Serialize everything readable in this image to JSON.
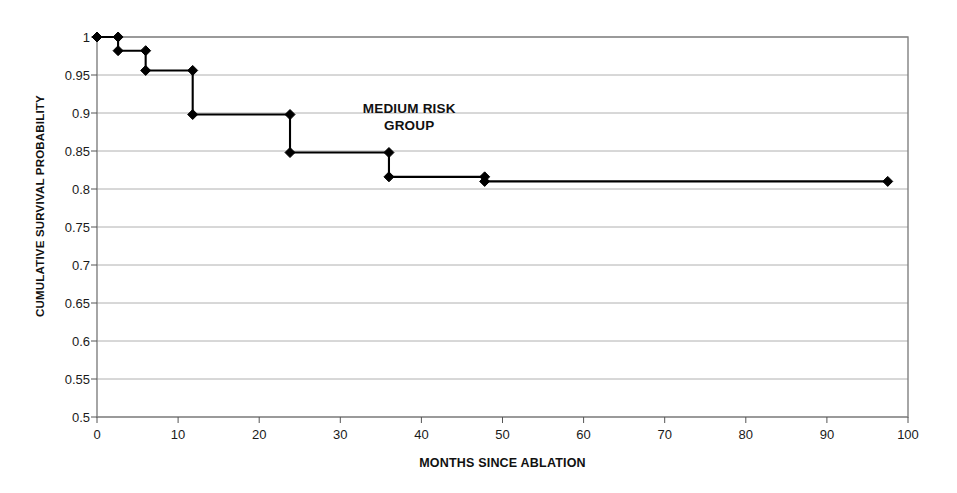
{
  "figure": {
    "background_color": "#ffffff",
    "plot_border_color": "#808080",
    "gridline_color": "#b0b0b0",
    "series_color": "#000000"
  },
  "chart_data": {
    "type": "line",
    "subtype": "kaplan-meier-step",
    "title": "",
    "xlabel": "MONTHS SINCE ABLATION",
    "ylabel": "CUMULATIVE SURVIVAL PROBABILITY",
    "xlim": [
      0,
      100
    ],
    "ylim": [
      0.5,
      1
    ],
    "xticks": [
      0,
      10,
      20,
      30,
      40,
      50,
      60,
      70,
      80,
      90,
      100
    ],
    "xtick_labels": [
      "0",
      "10",
      "20",
      "30",
      "40",
      "50",
      "60",
      "70",
      "80",
      "90",
      "100"
    ],
    "yticks": [
      0.5,
      0.55,
      0.6,
      0.65,
      0.7,
      0.75,
      0.8,
      0.85,
      0.9,
      0.95,
      1
    ],
    "ytick_labels": [
      "0.5",
      "0.55",
      "0.6",
      "0.65",
      "0.7",
      "0.75",
      "0.8",
      "0.85",
      "0.9",
      "0.95",
      "1"
    ],
    "grid": "horizontal",
    "legend": null,
    "annotations": [
      {
        "text": "MEDIUM RISK\nGROUP",
        "x": 38.5,
        "y": 0.905
      }
    ],
    "series": [
      {
        "name": "Medium risk group",
        "marker": "diamond",
        "x": [
          0,
          2.6,
          2.6,
          6.0,
          6.0,
          11.8,
          11.8,
          23.8,
          23.8,
          36.0,
          36.0,
          47.8,
          47.8,
          97.5
        ],
        "y": [
          1.0,
          1.0,
          0.982,
          0.982,
          0.956,
          0.956,
          0.898,
          0.898,
          0.848,
          0.848,
          0.816,
          0.816,
          0.81,
          0.81
        ],
        "marker_points": [
          {
            "x": 0,
            "y": 1.0
          },
          {
            "x": 2.6,
            "y": 1.0
          },
          {
            "x": 2.6,
            "y": 0.982
          },
          {
            "x": 6.0,
            "y": 0.982
          },
          {
            "x": 6.0,
            "y": 0.956
          },
          {
            "x": 11.8,
            "y": 0.956
          },
          {
            "x": 11.8,
            "y": 0.898
          },
          {
            "x": 23.8,
            "y": 0.898
          },
          {
            "x": 23.8,
            "y": 0.848
          },
          {
            "x": 36.0,
            "y": 0.848
          },
          {
            "x": 36.0,
            "y": 0.816
          },
          {
            "x": 47.8,
            "y": 0.816
          },
          {
            "x": 47.8,
            "y": 0.81
          },
          {
            "x": 97.5,
            "y": 0.81
          }
        ]
      }
    ]
  }
}
